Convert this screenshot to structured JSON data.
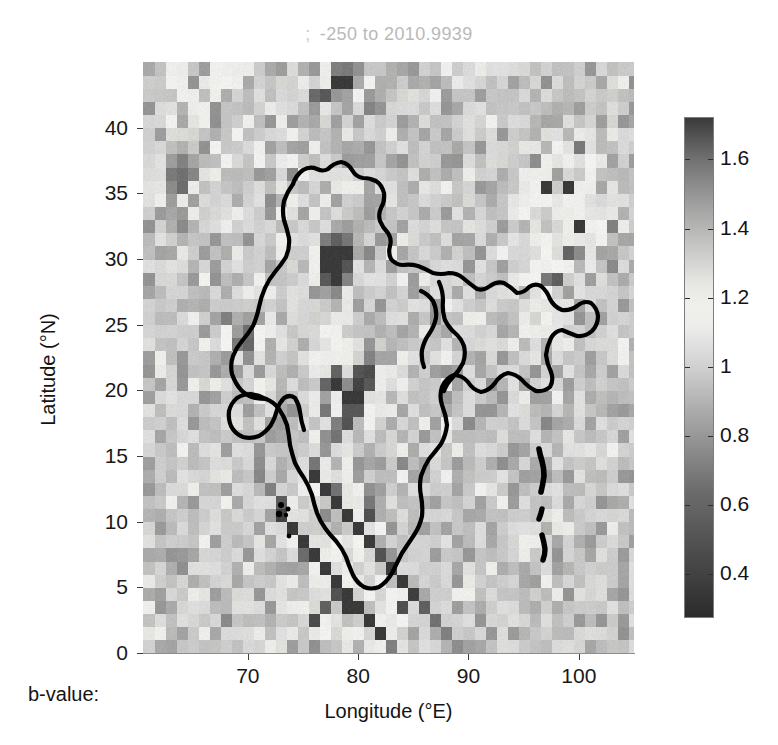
{
  "figure": {
    "title_semicolon": ";",
    "title_text": "-250 to 2010.9939",
    "bvalue_label": "b-value:",
    "background_color": "#ffffff",
    "title_color": "#b9b9b9"
  },
  "chart_data": {
    "type": "heatmap",
    "xlabel": "Longitude (°E)",
    "ylabel": "Latitude (°N)",
    "xlim": [
      60.5,
      105.0
    ],
    "ylim": [
      0.0,
      45.0
    ],
    "xticks": [
      70,
      80,
      90,
      100
    ],
    "xticklabels": [
      "70",
      "80",
      "90",
      "100"
    ],
    "yticks": [
      0,
      5,
      10,
      15,
      20,
      25,
      30,
      35,
      40
    ],
    "yticklabels": [
      "0",
      "5",
      "10",
      "15",
      "20",
      "25",
      "30",
      "35",
      "40"
    ],
    "grid": false,
    "legend": "none",
    "cell_size_deg": 1.0,
    "colorbar": {
      "label": "b-value",
      "position": "right",
      "vmin": 0.27,
      "vmax": 1.72,
      "ticks": [
        0.4,
        0.6,
        0.8,
        1,
        1.2,
        1.4,
        1.6
      ],
      "ticklabels": [
        "0.4",
        "0.6",
        "0.8",
        "1",
        "1.2",
        "1.4",
        "1.6"
      ],
      "colormap": "gray-diverging-dark-light-dark",
      "stops": [
        {
          "t": 0.0,
          "color": "#2b2b2b"
        },
        {
          "t": 0.12,
          "color": "#4a4a4a"
        },
        {
          "t": 0.26,
          "color": "#6e6e6e"
        },
        {
          "t": 0.4,
          "color": "#a6a6a6"
        },
        {
          "t": 0.52,
          "color": "#d8d8d8"
        },
        {
          "t": 0.6,
          "color": "#f2f2f0"
        },
        {
          "t": 0.66,
          "color": "#eaeae7"
        },
        {
          "t": 0.74,
          "color": "#c8c8c6"
        },
        {
          "t": 0.84,
          "color": "#9a9a9a"
        },
        {
          "t": 0.93,
          "color": "#6a6a6a"
        },
        {
          "t": 1.0,
          "color": "#3a3a3a"
        }
      ]
    },
    "value_range_note": "b-value per 1-degree cell; pale = ~0.9-1.05, dark = high (>1.3) or low (<0.7)",
    "cells": [
      {
        "lon": 61,
        "lat": 44,
        "v": 0.95
      },
      {
        "lon": 62,
        "lat": 44,
        "v": 1.18
      },
      {
        "lon": 63,
        "lat": 44,
        "v": 1.2
      },
      {
        "lon": 64,
        "lat": 44,
        "v": 0.96
      },
      {
        "lon": 66,
        "lat": 44,
        "v": 1.16
      },
      {
        "lon": 67,
        "lat": 44,
        "v": 1.18
      },
      {
        "lon": 68,
        "lat": 44,
        "v": 1.2
      },
      {
        "lon": 69,
        "lat": 44,
        "v": 1.22
      },
      {
        "lon": 70,
        "lat": 44,
        "v": 0.98
      },
      {
        "lon": 74,
        "lat": 44,
        "v": 1.4
      },
      {
        "lon": 75,
        "lat": 44,
        "v": 1.42
      },
      {
        "lon": 76,
        "lat": 44,
        "v": 1.02
      },
      {
        "lon": 77,
        "lat": 44,
        "v": 1.44
      },
      {
        "lon": 78,
        "lat": 44,
        "v": 1.46
      },
      {
        "lon": 79,
        "lat": 44,
        "v": 1.44
      },
      {
        "lon": 82,
        "lat": 44,
        "v": 1.42
      },
      {
        "lon": 83,
        "lat": 44,
        "v": 1.45
      },
      {
        "lon": 87,
        "lat": 44,
        "v": 1.12
      },
      {
        "lon": 62,
        "lat": 43,
        "v": 1.15
      },
      {
        "lon": 63,
        "lat": 43,
        "v": 1.18
      },
      {
        "lon": 65,
        "lat": 43,
        "v": 1.1
      },
      {
        "lon": 67,
        "lat": 43,
        "v": 1.14
      },
      {
        "lon": 68,
        "lat": 43,
        "v": 1.17
      },
      {
        "lon": 72,
        "lat": 43,
        "v": 1.3
      },
      {
        "lon": 73,
        "lat": 43,
        "v": 1.28
      },
      {
        "lon": 77,
        "lat": 43,
        "v": 1.48
      },
      {
        "lon": 78,
        "lat": 43,
        "v": 1.5
      },
      {
        "lon": 79,
        "lat": 43,
        "v": 1.3
      },
      {
        "lon": 81,
        "lat": 43,
        "v": 1.4
      },
      {
        "lon": 82,
        "lat": 43,
        "v": 1.42
      },
      {
        "lon": 84,
        "lat": 43,
        "v": 1.44
      },
      {
        "lon": 85,
        "lat": 43,
        "v": 1.42
      },
      {
        "lon": 88,
        "lat": 43,
        "v": 1.1
      },
      {
        "lon": 63,
        "lat": 42,
        "v": 1.16
      },
      {
        "lon": 64,
        "lat": 42,
        "v": 1.19
      },
      {
        "lon": 66,
        "lat": 42,
        "v": 1.12
      },
      {
        "lon": 70,
        "lat": 42,
        "v": 1.05
      },
      {
        "lon": 75,
        "lat": 42,
        "v": 1.46
      },
      {
        "lon": 76,
        "lat": 42,
        "v": 1.48
      },
      {
        "lon": 77,
        "lat": 42,
        "v": 1.2
      },
      {
        "lon": 80,
        "lat": 42,
        "v": 1.38
      },
      {
        "lon": 81,
        "lat": 42,
        "v": 1.4
      },
      {
        "lon": 83,
        "lat": 42,
        "v": 1.3
      },
      {
        "lon": 97,
        "lat": 42,
        "v": 1.35
      },
      {
        "lon": 98,
        "lat": 42,
        "v": 1.38
      },
      {
        "lon": 99,
        "lat": 42,
        "v": 1.36
      },
      {
        "lon": 101,
        "lat": 42,
        "v": 1.34
      },
      {
        "lon": 102,
        "lat": 42,
        "v": 1.32
      },
      {
        "lon": 64,
        "lat": 41,
        "v": 1.2
      },
      {
        "lon": 65,
        "lat": 41,
        "v": 1.18
      },
      {
        "lon": 71,
        "lat": 41,
        "v": 1.1
      },
      {
        "lon": 74,
        "lat": 41,
        "v": 1.35
      },
      {
        "lon": 75,
        "lat": 41,
        "v": 1.42
      },
      {
        "lon": 78,
        "lat": 41,
        "v": 1.34
      },
      {
        "lon": 82,
        "lat": 41,
        "v": 1.3
      },
      {
        "lon": 96,
        "lat": 41,
        "v": 1.38
      },
      {
        "lon": 97,
        "lat": 41,
        "v": 1.42
      },
      {
        "lon": 98,
        "lat": 41,
        "v": 1.4
      },
      {
        "lon": 100,
        "lat": 41,
        "v": 1.33
      },
      {
        "lon": 101,
        "lat": 41,
        "v": 1.36
      },
      {
        "lon": 62,
        "lat": 40,
        "v": 1.15
      },
      {
        "lon": 65,
        "lat": 40,
        "v": 1.12
      },
      {
        "lon": 72,
        "lat": 40,
        "v": 1.22
      },
      {
        "lon": 76,
        "lat": 40,
        "v": 1.3
      },
      {
        "lon": 80,
        "lat": 40,
        "v": 1.28
      },
      {
        "lon": 95,
        "lat": 40,
        "v": 1.4
      },
      {
        "lon": 96,
        "lat": 40,
        "v": 1.44
      },
      {
        "lon": 97,
        "lat": 40,
        "v": 1.42
      },
      {
        "lon": 99,
        "lat": 40,
        "v": 1.34
      },
      {
        "lon": 102,
        "lat": 40,
        "v": 1.3
      },
      {
        "lon": 63,
        "lat": 39,
        "v": 1.28
      },
      {
        "lon": 64,
        "lat": 39,
        "v": 1.3
      },
      {
        "lon": 68,
        "lat": 39,
        "v": 1.14
      },
      {
        "lon": 73,
        "lat": 39,
        "v": 1.18
      },
      {
        "lon": 78,
        "lat": 39,
        "v": 1.24
      },
      {
        "lon": 94,
        "lat": 39,
        "v": 1.36
      },
      {
        "lon": 95,
        "lat": 39,
        "v": 1.38
      },
      {
        "lon": 98,
        "lat": 39,
        "v": 1.3
      },
      {
        "lon": 62,
        "lat": 38,
        "v": 1.35
      },
      {
        "lon": 63,
        "lat": 38,
        "v": 1.38
      },
      {
        "lon": 64,
        "lat": 38,
        "v": 1.32
      },
      {
        "lon": 66,
        "lat": 38,
        "v": 1.15
      },
      {
        "lon": 70,
        "lat": 38,
        "v": 1.12
      },
      {
        "lon": 75,
        "lat": 38,
        "v": 1.2
      },
      {
        "lon": 93,
        "lat": 38,
        "v": 1.32
      },
      {
        "lon": 96,
        "lat": 38,
        "v": 1.28
      },
      {
        "lon": 62,
        "lat": 37,
        "v": 1.4
      },
      {
        "lon": 63,
        "lat": 37,
        "v": 1.42
      },
      {
        "lon": 64,
        "lat": 37,
        "v": 1.36
      },
      {
        "lon": 65,
        "lat": 37,
        "v": 1.34
      },
      {
        "lon": 67,
        "lat": 37,
        "v": 1.16
      },
      {
        "lon": 72,
        "lat": 37,
        "v": 1.1
      },
      {
        "lon": 76,
        "lat": 37,
        "v": 1.28
      },
      {
        "lon": 92,
        "lat": 37,
        "v": 1.3
      },
      {
        "lon": 62,
        "lat": 36,
        "v": 1.38
      },
      {
        "lon": 63,
        "lat": 36,
        "v": 1.44
      },
      {
        "lon": 64,
        "lat": 36,
        "v": 1.4
      },
      {
        "lon": 66,
        "lat": 36,
        "v": 1.2
      },
      {
        "lon": 74,
        "lat": 36,
        "v": 1.18
      },
      {
        "lon": 78,
        "lat": 36,
        "v": 1.26
      },
      {
        "lon": 62,
        "lat": 35,
        "v": 1.34
      },
      {
        "lon": 63,
        "lat": 35,
        "v": 1.38
      },
      {
        "lon": 65,
        "lat": 35,
        "v": 1.22
      },
      {
        "lon": 77,
        "lat": 35,
        "v": 1.24
      },
      {
        "lon": 62,
        "lat": 34,
        "v": 1.3
      },
      {
        "lon": 64,
        "lat": 34,
        "v": 1.26
      },
      {
        "lon": 76,
        "lat": 34,
        "v": 1.22
      },
      {
        "lon": 62,
        "lat": 33,
        "v": 1.28
      },
      {
        "lon": 63,
        "lat": 33,
        "v": 1.32
      },
      {
        "lon": 75,
        "lat": 33,
        "v": 1.2
      },
      {
        "lon": 78,
        "lat": 33,
        "v": 1.34
      },
      {
        "lon": 79,
        "lat": 33,
        "v": 1.38
      },
      {
        "lon": 62,
        "lat": 32,
        "v": 1.35
      },
      {
        "lon": 63,
        "lat": 32,
        "v": 1.4
      },
      {
        "lon": 64,
        "lat": 32,
        "v": 1.3
      },
      {
        "lon": 77,
        "lat": 32,
        "v": 1.44
      },
      {
        "lon": 78,
        "lat": 32,
        "v": 1.48
      },
      {
        "lon": 79,
        "lat": 32,
        "v": 1.42
      },
      {
        "lon": 62,
        "lat": 31,
        "v": 1.3
      },
      {
        "lon": 76,
        "lat": 31,
        "v": 1.46
      },
      {
        "lon": 77,
        "lat": 31,
        "v": 1.52
      },
      {
        "lon": 78,
        "lat": 31,
        "v": 1.5
      },
      {
        "lon": 79,
        "lat": 31,
        "v": 1.4
      },
      {
        "lon": 63,
        "lat": 30,
        "v": 1.24
      },
      {
        "lon": 76,
        "lat": 30,
        "v": 1.48
      },
      {
        "lon": 77,
        "lat": 30,
        "v": 1.55
      },
      {
        "lon": 78,
        "lat": 30,
        "v": 1.52
      },
      {
        "lon": 79,
        "lat": 30,
        "v": 1.38
      },
      {
        "lon": 62,
        "lat": 29,
        "v": 1.26
      },
      {
        "lon": 76,
        "lat": 29,
        "v": 1.44
      },
      {
        "lon": 77,
        "lat": 29,
        "v": 1.5
      },
      {
        "lon": 78,
        "lat": 29,
        "v": 1.46
      },
      {
        "lon": 70,
        "lat": 28,
        "v": 1.18
      },
      {
        "lon": 76,
        "lat": 28,
        "v": 1.4
      },
      {
        "lon": 77,
        "lat": 28,
        "v": 1.44
      },
      {
        "lon": 78,
        "lat": 28,
        "v": 1.4
      },
      {
        "lon": 69,
        "lat": 27,
        "v": 1.22
      },
      {
        "lon": 70,
        "lat": 27,
        "v": 1.26
      },
      {
        "lon": 76,
        "lat": 27,
        "v": 1.36
      },
      {
        "lon": 77,
        "lat": 27,
        "v": 1.38
      },
      {
        "lon": 69,
        "lat": 26,
        "v": 1.28
      },
      {
        "lon": 70,
        "lat": 26,
        "v": 1.32
      },
      {
        "lon": 75,
        "lat": 26,
        "v": 1.3
      },
      {
        "lon": 76,
        "lat": 26,
        "v": 1.34
      },
      {
        "lon": 68,
        "lat": 25,
        "v": 1.3
      },
      {
        "lon": 69,
        "lat": 25,
        "v": 1.36
      },
      {
        "lon": 70,
        "lat": 25,
        "v": 1.34
      },
      {
        "lon": 75,
        "lat": 25,
        "v": 1.32
      },
      {
        "lon": 68,
        "lat": 24,
        "v": 1.34
      },
      {
        "lon": 69,
        "lat": 24,
        "v": 1.4
      },
      {
        "lon": 74,
        "lat": 24,
        "v": 1.3
      },
      {
        "lon": 80,
        "lat": 24,
        "v": 1.28
      },
      {
        "lon": 68,
        "lat": 23,
        "v": 1.38
      },
      {
        "lon": 69,
        "lat": 23,
        "v": 1.44
      },
      {
        "lon": 73,
        "lat": 23,
        "v": 1.32
      },
      {
        "lon": 80,
        "lat": 23,
        "v": 1.32
      },
      {
        "lon": 69,
        "lat": 22,
        "v": 1.4
      },
      {
        "lon": 73,
        "lat": 22,
        "v": 1.36
      },
      {
        "lon": 80,
        "lat": 22,
        "v": 1.36
      },
      {
        "lon": 81,
        "lat": 22,
        "v": 1.34
      },
      {
        "lon": 72,
        "lat": 21,
        "v": 1.38
      },
      {
        "lon": 79,
        "lat": 21,
        "v": 1.38
      },
      {
        "lon": 80,
        "lat": 21,
        "v": 1.42
      },
      {
        "lon": 72,
        "lat": 20,
        "v": 1.4
      },
      {
        "lon": 79,
        "lat": 20,
        "v": 1.4
      },
      {
        "lon": 80,
        "lat": 20,
        "v": 1.44
      },
      {
        "lon": 72,
        "lat": 19,
        "v": 1.42
      },
      {
        "lon": 78,
        "lat": 19,
        "v": 1.42
      },
      {
        "lon": 79,
        "lat": 19,
        "v": 1.46
      },
      {
        "lon": 72,
        "lat": 18,
        "v": 1.44
      },
      {
        "lon": 78,
        "lat": 18,
        "v": 1.44
      },
      {
        "lon": 79,
        "lat": 18,
        "v": 1.48
      },
      {
        "lon": 71,
        "lat": 17,
        "v": 1.46
      },
      {
        "lon": 77,
        "lat": 17,
        "v": 1.46
      },
      {
        "lon": 78,
        "lat": 17,
        "v": 1.5
      },
      {
        "lon": 71,
        "lat": 16,
        "v": 1.48
      },
      {
        "lon": 76,
        "lat": 16,
        "v": 1.48
      },
      {
        "lon": 77,
        "lat": 16,
        "v": 1.52
      },
      {
        "lon": 70,
        "lat": 15,
        "v": 1.5
      },
      {
        "lon": 76,
        "lat": 15,
        "v": 1.5
      },
      {
        "lon": 82,
        "lat": 15,
        "v": 1.3
      },
      {
        "lon": 70,
        "lat": 14,
        "v": 1.52
      },
      {
        "lon": 75,
        "lat": 14,
        "v": 1.52
      },
      {
        "lon": 82,
        "lat": 14,
        "v": 1.34
      },
      {
        "lon": 70,
        "lat": 13,
        "v": 1.54
      },
      {
        "lon": 75,
        "lat": 13,
        "v": 1.54
      },
      {
        "lon": 81,
        "lat": 13,
        "v": 1.38
      },
      {
        "lon": 71,
        "lat": 12,
        "v": 1.56
      },
      {
        "lon": 76,
        "lat": 12,
        "v": 1.56
      },
      {
        "lon": 81,
        "lat": 12,
        "v": 1.42
      },
      {
        "lon": 72,
        "lat": 11,
        "v": 1.58
      },
      {
        "lon": 77,
        "lat": 11,
        "v": 1.58
      },
      {
        "lon": 80,
        "lat": 11,
        "v": 1.46
      },
      {
        "lon": 72,
        "lat": 10,
        "v": 1.6
      },
      {
        "lon": 78,
        "lat": 10,
        "v": 1.6
      },
      {
        "lon": 80,
        "lat": 10,
        "v": 1.5
      },
      {
        "lon": 73,
        "lat": 9,
        "v": 1.6
      },
      {
        "lon": 79,
        "lat": 9,
        "v": 1.62
      },
      {
        "lon": 74,
        "lat": 8,
        "v": 1.62
      },
      {
        "lon": 80,
        "lat": 8,
        "v": 1.64
      },
      {
        "lon": 75,
        "lat": 7,
        "v": 1.64
      },
      {
        "lon": 81,
        "lat": 7,
        "v": 1.66
      },
      {
        "lon": 76,
        "lat": 6,
        "v": 1.66
      },
      {
        "lon": 82,
        "lat": 6,
        "v": 1.68
      },
      {
        "lon": 77,
        "lat": 5,
        "v": 1.66
      },
      {
        "lon": 83,
        "lat": 5,
        "v": 1.68
      },
      {
        "lon": 78,
        "lat": 4,
        "v": 1.64
      },
      {
        "lon": 84,
        "lat": 4,
        "v": 1.66
      },
      {
        "lon": 79,
        "lat": 3,
        "v": 1.62
      },
      {
        "lon": 85,
        "lat": 3,
        "v": 1.64
      },
      {
        "lon": 80,
        "lat": 2,
        "v": 1.6
      },
      {
        "lon": 86,
        "lat": 2,
        "v": 1.6
      },
      {
        "lon": 81,
        "lat": 1,
        "v": 1.56
      },
      {
        "lon": 87,
        "lat": 1,
        "v": 1.56
      },
      {
        "lon": 82,
        "lat": 0,
        "v": 1.52
      },
      {
        "lon": 88,
        "lat": 0,
        "v": 1.52
      }
    ]
  },
  "map_overlay": {
    "name": "india-outline",
    "color": "#000000",
    "islands": [
      "andaman",
      "nicobar",
      "lakshadweep"
    ]
  }
}
